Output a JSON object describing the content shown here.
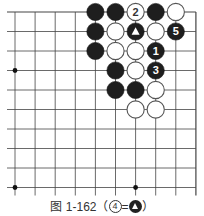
{
  "diagram": {
    "type": "go-board-fragment",
    "grid": {
      "cols": 10,
      "rows": 10,
      "x0": 15,
      "dx": 20.1,
      "y0": 12,
      "dy": 19.5,
      "right_edge_col": 9,
      "top_edge_row": 0,
      "line_color": "#444444"
    },
    "star_points": [
      {
        "col": 0,
        "row": 3
      },
      {
        "col": 0,
        "row": 9
      },
      {
        "col": 6,
        "row": 9
      }
    ],
    "stones": [
      {
        "col": 4,
        "row": 0,
        "color": "black",
        "label": ""
      },
      {
        "col": 5,
        "row": 0,
        "color": "black",
        "label": ""
      },
      {
        "col": 6,
        "row": 0,
        "color": "white",
        "label": "2"
      },
      {
        "col": 7,
        "row": 0,
        "color": "black",
        "label": ""
      },
      {
        "col": 8,
        "row": 0,
        "color": "white",
        "label": ""
      },
      {
        "col": 4,
        "row": 1,
        "color": "black",
        "label": ""
      },
      {
        "col": 5,
        "row": 1,
        "color": "white",
        "label": ""
      },
      {
        "col": 6,
        "row": 1,
        "color": "black",
        "label": "triangle"
      },
      {
        "col": 7,
        "row": 1,
        "color": "white",
        "label": ""
      },
      {
        "col": 8,
        "row": 1,
        "color": "black",
        "label": "5"
      },
      {
        "col": 4,
        "row": 2,
        "color": "black",
        "label": ""
      },
      {
        "col": 5,
        "row": 2,
        "color": "white",
        "label": ""
      },
      {
        "col": 6,
        "row": 2,
        "color": "white",
        "label": ""
      },
      {
        "col": 7,
        "row": 2,
        "color": "black",
        "label": "1"
      },
      {
        "col": 5,
        "row": 3,
        "color": "black",
        "label": ""
      },
      {
        "col": 6,
        "row": 3,
        "color": "white",
        "label": ""
      },
      {
        "col": 7,
        "row": 3,
        "color": "black",
        "label": "3"
      },
      {
        "col": 5,
        "row": 4,
        "color": "black",
        "label": ""
      },
      {
        "col": 6,
        "row": 4,
        "color": "black",
        "label": ""
      },
      {
        "col": 7,
        "row": 4,
        "color": "white",
        "label": ""
      },
      {
        "col": 6,
        "row": 5,
        "color": "white",
        "label": ""
      },
      {
        "col": 7,
        "row": 5,
        "color": "white",
        "label": ""
      }
    ]
  },
  "caption": {
    "prefix": "图 1-162（",
    "circled_number": "4",
    "equals": "=",
    "suffix": "）"
  }
}
